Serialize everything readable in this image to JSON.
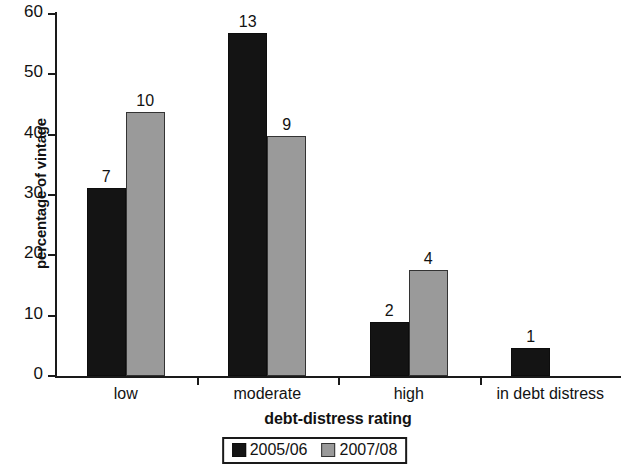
{
  "chart_data": {
    "type": "bar",
    "title": "",
    "xlabel": "debt-distress rating",
    "ylabel": "percentage of vintage",
    "categories": [
      "low",
      "moderate",
      "high",
      "in debt distress"
    ],
    "ylim": [
      0,
      60
    ],
    "yticks": [
      0,
      10,
      20,
      30,
      40,
      50,
      60
    ],
    "ytick_labels": [
      "0",
      "10",
      "20",
      "30",
      "40",
      "50",
      "60"
    ],
    "grid": false,
    "legend_position": "bottom",
    "series": [
      {
        "name": "2005/06",
        "color": "#141414",
        "values": [
          31.2,
          56.9,
          9.0,
          4.6
        ],
        "labels": [
          "7",
          "13",
          "2",
          "1"
        ]
      },
      {
        "name": "2007/08",
        "color": "#9a9a9a",
        "values": [
          43.8,
          39.8,
          17.6,
          null
        ],
        "labels": [
          "10",
          "9",
          "4",
          ""
        ]
      }
    ]
  },
  "axes": {
    "y_title": "percentage of vintage",
    "x_title": "debt-distress rating"
  }
}
